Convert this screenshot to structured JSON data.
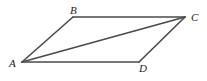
{
  "diagram": {
    "type": "parallelogram-with-diagonal",
    "vertices": [
      {
        "label": "A",
        "x": 22,
        "y": 62,
        "label_x": 9,
        "label_y": 67
      },
      {
        "label": "B",
        "x": 73,
        "y": 17,
        "label_x": 70,
        "label_y": 14
      },
      {
        "label": "C",
        "x": 185,
        "y": 17,
        "label_x": 191,
        "label_y": 21
      },
      {
        "label": "D",
        "x": 139,
        "y": 62,
        "label_x": 139,
        "label_y": 72
      }
    ],
    "edges": [
      {
        "from": "A",
        "to": "B"
      },
      {
        "from": "B",
        "to": "C"
      },
      {
        "from": "C",
        "to": "D"
      },
      {
        "from": "D",
        "to": "A"
      },
      {
        "from": "A",
        "to": "C"
      }
    ],
    "colors": {
      "stroke": "#4a4a4a",
      "label": "#222222",
      "background": "#ffffff"
    }
  }
}
